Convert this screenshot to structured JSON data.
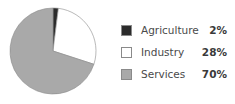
{
  "chart_data": {
    "type": "pie",
    "title": "",
    "categories": [
      "Agriculture",
      "Industry",
      "Services"
    ],
    "values": [
      2,
      28,
      70
    ],
    "labels": [
      "2%",
      "28%",
      "70%"
    ],
    "colors": [
      "#2b2b2b",
      "#ffffff",
      "#a9a9a9"
    ],
    "start_angle": "top (12 o'clock)",
    "direction": "clockwise",
    "legend_position": "right"
  },
  "legend": {
    "items": [
      {
        "label": "Agriculture",
        "value": "2%",
        "color": "#2b2b2b"
      },
      {
        "label": "Industry",
        "value": "28%",
        "color": "#ffffff"
      },
      {
        "label": "Services",
        "value": "70%",
        "color": "#a9a9a9"
      }
    ]
  }
}
